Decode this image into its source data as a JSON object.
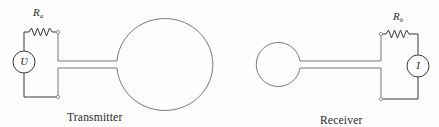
{
  "diagram": {
    "type": "antenna transmitter-receiver schematic",
    "transmitter": {
      "caption": "Transmitter",
      "resistor": {
        "symbol": "R",
        "subscript": "a"
      },
      "source": {
        "symbol": "Ʋ",
        "icon": "voltage-source-icon"
      },
      "antenna": {
        "shape": "large loop / sphere",
        "icon": "large-circle-antenna"
      }
    },
    "receiver": {
      "caption": "Receiver",
      "resistor": {
        "symbol": "R",
        "subscript": "b"
      },
      "meter": {
        "symbol": "I",
        "icon": "current-meter-icon"
      },
      "antenna": {
        "shape": "small loop / sphere",
        "icon": "small-circle-antenna"
      }
    },
    "colors": {
      "line": "#3a3a3a",
      "background": "#fdfdfc",
      "text": "#2a2a2a"
    }
  }
}
